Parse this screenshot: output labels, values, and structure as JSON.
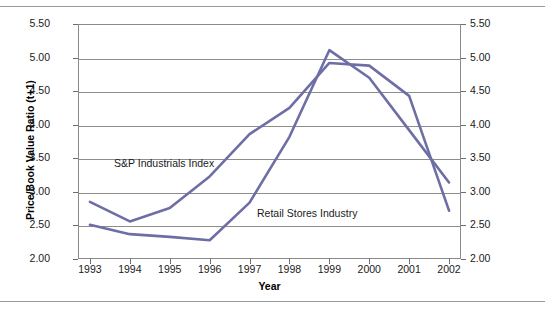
{
  "chart_data": {
    "type": "line",
    "title": "",
    "subtitle": "",
    "xlabel": "Year",
    "ylabel": "Price/Book Value Ratio (t+1)",
    "ylabel_right": "Price/Book Value Ratio (t+1)",
    "categories": [
      "1993",
      "1994",
      "1995",
      "1996",
      "1997",
      "1998",
      "1999",
      "2000",
      "2001",
      "2002"
    ],
    "x": [
      1993,
      1994,
      1995,
      1996,
      1997,
      1998,
      1999,
      2000,
      2001,
      2002
    ],
    "xlim": [
      1992.7,
      2002.3
    ],
    "ylim": [
      2.0,
      5.5
    ],
    "ytick_values": [
      2.0,
      2.5,
      3.0,
      3.5,
      4.0,
      4.5,
      5.0,
      5.5
    ],
    "ytick_labels": [
      "2.00",
      "2.50",
      "3.00",
      "3.50",
      "4.00",
      "4.50",
      "5.00",
      "5.50"
    ],
    "ytick_labels_right": [
      "2.00",
      "2.50",
      "3.00",
      "3.50",
      "4.00",
      "4.50",
      "5.00",
      "5.50"
    ],
    "grid": true,
    "grid_axis": "y",
    "legend": "inline-annotations",
    "dual_y_axis": true,
    "series": [
      {
        "name": "S&P Industrials Index",
        "color": "#6e6ea6",
        "values": [
          2.85,
          2.56,
          2.76,
          3.23,
          3.86,
          4.25,
          4.92,
          4.88,
          4.43,
          2.72
        ]
      },
      {
        "name": "Retail Stores Industry",
        "color": "#6e6ea6",
        "values": [
          2.51,
          2.37,
          2.33,
          2.28,
          2.84,
          3.82,
          5.11,
          4.7,
          3.92,
          3.14
        ]
      }
    ],
    "annotations": [
      {
        "id": "sp",
        "text": "S&P Industrials Index"
      },
      {
        "id": "retail",
        "text": "Retail Stores Industry"
      }
    ],
    "colors": {
      "series_line": "#6e6ea6",
      "grid": "#8d8d8d",
      "axis": "#8a8a8a",
      "text": "#1a1a1a",
      "background": "#ffffff"
    }
  }
}
